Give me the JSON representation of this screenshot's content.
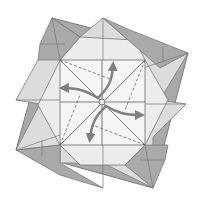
{
  "diagram": {
    "type": "origami-fold-diagram",
    "colors": {
      "background": "#ffffff",
      "dark_paper": "#a9a9a9",
      "light_paper": "#e6e6e6",
      "lighter_paper": "#f3f3f3",
      "line": "#7a7a7a",
      "arrow": "#808080"
    },
    "arrows": [
      {
        "direction": "up-right",
        "meaning": "squash-open"
      },
      {
        "direction": "left",
        "meaning": "squash-open"
      },
      {
        "direction": "down-left",
        "meaning": "squash-open"
      },
      {
        "direction": "right",
        "meaning": "squash-open"
      }
    ],
    "fold_lines": {
      "valley_dashed_count": 4,
      "creases": [
        "diagonal",
        "anti-diagonal",
        "horizontal",
        "vertical"
      ]
    }
  }
}
